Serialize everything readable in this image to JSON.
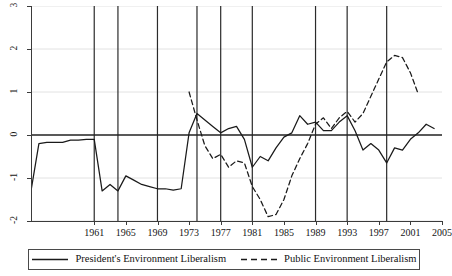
{
  "chart_data": {
    "type": "line",
    "title": "",
    "subtitle": "",
    "xlabel": "",
    "ylabel": "",
    "xlim": [
      1953,
      2005
    ],
    "ylim": [
      -2,
      3
    ],
    "grid": true,
    "gridlines_y": [
      3,
      2,
      1,
      0,
      -1,
      -2
    ],
    "zero_line": 0,
    "legend_position": "bottom",
    "y_ticks": [
      3,
      2,
      1,
      0,
      -1,
      -2
    ],
    "y_tick_labels": [
      "3",
      "2",
      "1",
      "0",
      "-1",
      "-2"
    ],
    "x_ticks": [
      1961,
      1965,
      1969,
      1973,
      1977,
      1981,
      1985,
      1989,
      1993,
      1997,
      2001,
      2005
    ],
    "x_tick_labels": [
      "1961",
      "1965",
      "1969",
      "1973",
      "1977",
      "1981",
      "1985",
      "1989",
      "1993",
      "1997",
      "2001",
      "2005"
    ],
    "election_year_markers": [
      1961,
      1964,
      1969,
      1974,
      1977,
      1981,
      1989,
      1993,
      1998
    ],
    "series": [
      {
        "name": "President's Environment Liberalism",
        "style": "solid",
        "color": "#1a1a1a",
        "x": [
          1953,
          1954,
          1955,
          1956,
          1957,
          1958,
          1959,
          1960,
          1961,
          1962,
          1963,
          1964,
          1965,
          1966,
          1967,
          1968,
          1969,
          1970,
          1971,
          1972,
          1973,
          1974,
          1975,
          1976,
          1977,
          1978,
          1979,
          1980,
          1981,
          1982,
          1983,
          1984,
          1985,
          1986,
          1987,
          1988,
          1989,
          1990,
          1991,
          1992,
          1993,
          1994,
          1995,
          1996,
          1997,
          1998,
          1999,
          2000,
          2001,
          2002,
          2003,
          2004
        ],
        "values": [
          -1.3,
          -0.2,
          -0.17,
          -0.17,
          -0.17,
          -0.12,
          -0.12,
          -0.1,
          -0.1,
          -1.3,
          -1.15,
          -1.3,
          -0.95,
          -1.05,
          -1.15,
          -1.2,
          -1.25,
          -1.25,
          -1.28,
          -1.25,
          0.05,
          0.5,
          0.35,
          0.2,
          0.05,
          0.15,
          0.2,
          -0.1,
          -0.75,
          -0.5,
          -0.6,
          -0.3,
          -0.05,
          0.05,
          0.45,
          0.25,
          0.3,
          0.1,
          0.1,
          0.3,
          0.45,
          0.1,
          -0.35,
          -0.2,
          -0.35,
          -0.65,
          -0.3,
          -0.35,
          -0.1,
          0.05,
          0.25,
          0.15
        ]
      },
      {
        "name": "Public Environment Liberalism",
        "style": "dashed",
        "color": "#1a1a1a",
        "x": [
          1973,
          1974,
          1975,
          1976,
          1977,
          1978,
          1979,
          1980,
          1981,
          1982,
          1983,
          1984,
          1985,
          1986,
          1987,
          1988,
          1989,
          1990,
          1991,
          1992,
          1993,
          1994,
          1995,
          1996,
          1997,
          1998,
          1999,
          2000,
          2001,
          2002
        ],
        "values": [
          1.0,
          0.35,
          -0.25,
          -0.55,
          -0.45,
          -0.75,
          -0.6,
          -0.65,
          -1.2,
          -1.5,
          -1.9,
          -1.85,
          -1.5,
          -0.95,
          -0.55,
          -0.2,
          0.25,
          0.4,
          0.15,
          0.4,
          0.55,
          0.3,
          0.5,
          0.9,
          1.3,
          1.7,
          1.85,
          1.8,
          1.45,
          0.95
        ]
      }
    ]
  },
  "legend": {
    "entries": [
      {
        "label": "President's Environment Liberalism",
        "style": "solid"
      },
      {
        "label": "Public Environment Liberalism",
        "style": "dashed"
      }
    ]
  }
}
